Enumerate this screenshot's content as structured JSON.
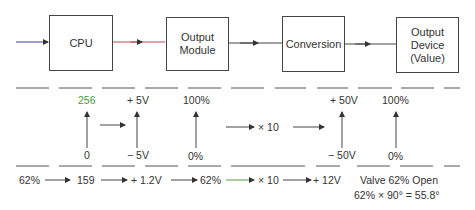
{
  "blocks": [
    {
      "id": "cpu",
      "label": "CPU"
    },
    {
      "id": "output_module",
      "label": "Output\nModule"
    },
    {
      "id": "conversion",
      "label": "Conversion"
    },
    {
      "id": "output_device",
      "label": "Output\nDevice\n(Value)"
    }
  ],
  "ranges": {
    "cpu": {
      "top": "256",
      "bottom": "0"
    },
    "module_volts": {
      "top": "+ 5V",
      "bottom": "− 5V"
    },
    "module_pct": {
      "top": "100%",
      "bottom": "0%"
    },
    "multiplier": "× 10",
    "conv_volts": {
      "top": "+ 50V",
      "bottom": "− 50V"
    },
    "device_pct": {
      "top": "100%",
      "bottom": "0%"
    }
  },
  "example_row": {
    "input_pct": "62%",
    "cpu_value": "159",
    "module_volts": "+ 1.2V",
    "module_pct": "62%",
    "multiplier": "× 10",
    "output_volts": "+ 12V",
    "result_line1": "Valve 62% Open",
    "result_line2": "62% × 90° = 55.8°"
  },
  "colors": {
    "input_line": "#3a3aa0",
    "cpu_to_module_line": "#c0485a",
    "green_accent": "#4a9a3a",
    "line": "#444444"
  }
}
